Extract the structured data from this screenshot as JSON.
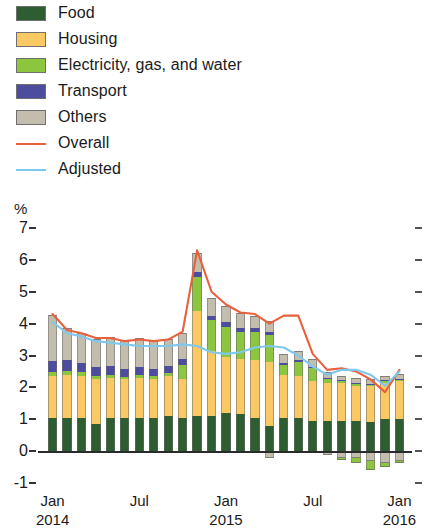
{
  "legend": {
    "items": [
      {
        "label": "Food",
        "color": "#2f5d32",
        "type": "swatch",
        "name": "legend-food"
      },
      {
        "label": "Housing",
        "color": "#fbc963",
        "type": "swatch",
        "name": "legend-housing"
      },
      {
        "label": "Electricity, gas, and water",
        "color": "#8cc63e",
        "type": "swatch",
        "name": "legend-electricity-gas-water"
      },
      {
        "label": "Transport",
        "color": "#4d4da0",
        "type": "swatch",
        "name": "legend-transport"
      },
      {
        "label": "Others",
        "color": "#c3bdae",
        "type": "swatch",
        "name": "legend-others"
      },
      {
        "label": "Overall",
        "color": "#e8603c",
        "type": "line",
        "name": "legend-overall"
      },
      {
        "label": "Adjusted",
        "color": "#7ec8ee",
        "type": "line",
        "name": "legend-adjusted"
      }
    ]
  },
  "axis": {
    "unit_label": "%",
    "y_ticks": [
      "7",
      "6",
      "5",
      "4",
      "3",
      "2",
      "1",
      "0",
      "-1"
    ],
    "y_min": -1,
    "y_max": 7,
    "x_ticks": [
      {
        "label": "Jan",
        "sub": "2014",
        "index": 0
      },
      {
        "label": "Jul",
        "sub": "",
        "index": 6
      },
      {
        "label": "Jan",
        "sub": "2015",
        "index": 12
      },
      {
        "label": "Jul",
        "sub": "",
        "index": 18
      },
      {
        "label": "Jan",
        "sub": "2016",
        "index": 24
      }
    ]
  },
  "chart_data": {
    "type": "bar",
    "stacked": true,
    "title": "",
    "xlabel": "",
    "ylabel": "%",
    "ylim": [
      -1,
      7
    ],
    "grid": false,
    "legend_position": "top-left",
    "categories": [
      "Jan 2014",
      "Feb 2014",
      "Mar 2014",
      "Apr 2014",
      "May 2014",
      "Jun 2014",
      "Jul 2014",
      "Aug 2014",
      "Sep 2014",
      "Oct 2014",
      "Nov 2014",
      "Dec 2014",
      "Jan 2015",
      "Feb 2015",
      "Mar 2015",
      "Apr 2015",
      "May 2015",
      "Jun 2015",
      "Jul 2015",
      "Aug 2015",
      "Sep 2015",
      "Oct 2015",
      "Nov 2015",
      "Dec 2015",
      "Jan 2016"
    ],
    "series": [
      {
        "name": "Food",
        "color": "#2f5d32",
        "values": [
          1.05,
          1.05,
          1.05,
          0.85,
          1.05,
          1.05,
          1.05,
          1.05,
          1.1,
          1.05,
          1.1,
          1.1,
          1.2,
          1.15,
          1.05,
          0.8,
          1.05,
          1.05,
          0.95,
          0.95,
          0.95,
          0.95,
          0.9,
          1.0,
          1.0
        ]
      },
      {
        "name": "Housing",
        "color": "#fbc963",
        "values": [
          1.3,
          1.35,
          1.3,
          1.4,
          1.25,
          1.2,
          1.25,
          1.2,
          1.25,
          1.2,
          3.3,
          2.05,
          1.75,
          1.75,
          1.8,
          2.0,
          1.35,
          1.3,
          1.25,
          1.2,
          1.2,
          1.1,
          1.15,
          1.15,
          1.2
        ]
      },
      {
        "name": "Electricity, gas, and water",
        "color": "#8cc63e",
        "values": [
          0.12,
          0.1,
          0.12,
          0.1,
          0.1,
          0.08,
          0.1,
          0.1,
          0.1,
          0.45,
          1.05,
          0.95,
          0.95,
          0.85,
          0.9,
          0.85,
          0.3,
          0.45,
          0.4,
          0.1,
          0.05,
          0.08,
          0.05,
          0.05,
          0.05
        ]
      },
      {
        "name": "Transport",
        "color": "#4d4da0",
        "values": [
          0.35,
          0.35,
          0.3,
          0.28,
          0.28,
          0.25,
          0.25,
          0.22,
          0.22,
          0.2,
          0.18,
          0.15,
          0.15,
          0.12,
          0.1,
          0.08,
          0.05,
          0.05,
          0.04,
          0.03,
          0.02,
          0.02,
          0.02,
          0.02,
          0.02
        ]
      },
      {
        "name": "Others",
        "color": "#c3bdae",
        "values": [
          1.45,
          1.0,
          0.95,
          0.9,
          0.9,
          0.9,
          0.9,
          0.9,
          0.85,
          0.8,
          0.6,
          0.55,
          0.5,
          0.45,
          0.4,
          0.35,
          0.3,
          0.3,
          0.25,
          0.2,
          0.15,
          0.15,
          0.15,
          0.15,
          0.15
        ]
      },
      {
        "name": "Negative contributions",
        "color": "#c3bdae",
        "negative": true,
        "values": [
          0,
          0,
          0,
          0,
          0,
          0,
          0,
          0,
          0,
          0,
          0,
          0,
          0,
          0,
          0,
          -0.22,
          0,
          0,
          -0.06,
          -0.12,
          -0.2,
          -0.22,
          -0.3,
          -0.38,
          -0.3
        ]
      },
      {
        "name": "Negative electricity",
        "color": "#8cc63e",
        "negative": true,
        "values": [
          0,
          0,
          0,
          0,
          0,
          0,
          0,
          0,
          0,
          0,
          0,
          0,
          0,
          0,
          0,
          0,
          0,
          0,
          0,
          0,
          -0.08,
          -0.16,
          -0.28,
          -0.12,
          -0.06
        ]
      }
    ],
    "lines": [
      {
        "name": "Overall",
        "color": "#e8603c",
        "values": [
          4.3,
          3.8,
          3.7,
          3.55,
          3.55,
          3.45,
          3.5,
          3.45,
          3.5,
          3.75,
          6.3,
          5.0,
          4.6,
          4.35,
          4.3,
          4.0,
          4.25,
          4.25,
          3.05,
          2.55,
          2.6,
          2.5,
          2.25,
          1.85,
          2.55
        ]
      },
      {
        "name": "Adjusted",
        "color": "#7ec8ee",
        "values": [
          4.05,
          3.7,
          3.6,
          3.45,
          3.4,
          3.35,
          3.3,
          3.3,
          3.3,
          3.35,
          3.3,
          3.1,
          3.05,
          3.1,
          3.25,
          3.3,
          3.25,
          3.0,
          2.65,
          2.4,
          2.55,
          2.55,
          2.4,
          2.05,
          2.5
        ]
      }
    ]
  }
}
